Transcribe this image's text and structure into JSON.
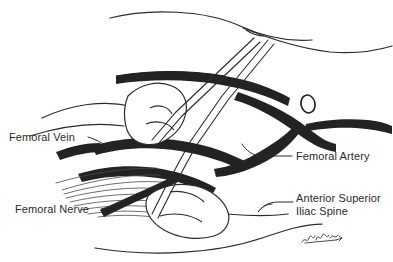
{
  "figure": {
    "background_color": "#ffffff",
    "ink_color": "#1a1a1a",
    "vessel_fill": "#232323",
    "line_color": "#2b2b2b",
    "signature": "artist-signature"
  },
  "labels": {
    "femoral_vein": "Femoral Vein",
    "femoral_nerve": "Femoral Nerve",
    "femoral_artery": "Femoral Artery",
    "asis_line1": "Anterior Superior",
    "asis_line2": "Iliac Spine"
  },
  "structures": {
    "inguinal_ligament": "inguinal-ligament",
    "femoral_artery_vessel": "femoral-artery-vessel",
    "femoral_vein_vessel": "femoral-vein-vessel",
    "femoral_nerve_fibers": "femoral-nerve-fibers",
    "iliac_spine_bone": "anterior-superior-iliac-spine",
    "pubic_bone": "pubic-bone",
    "thigh_outline": "thigh-outline",
    "abdomen_outline": "abdomen-outline"
  }
}
